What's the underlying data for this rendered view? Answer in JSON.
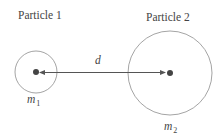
{
  "diagram": {
    "particle1": {
      "title": "Particle 1",
      "mass_symbol": "m",
      "mass_subscript": "1",
      "center": [
        36,
        72
      ],
      "radius": 21
    },
    "particle2": {
      "title": "Particle 2",
      "mass_symbol": "m",
      "mass_subscript": "2",
      "center": [
        170,
        73
      ],
      "radius": 42
    },
    "distance_label": "d",
    "colors": {
      "circle_stroke": "#9a9a9a",
      "line": "#555555",
      "dot": "#444444",
      "text": "#444444"
    }
  }
}
